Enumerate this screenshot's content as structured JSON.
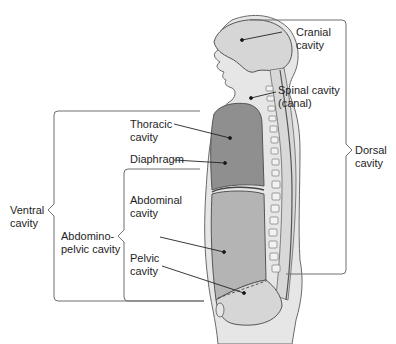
{
  "labels": {
    "cranial": [
      "Cranial",
      "cavity"
    ],
    "spinal": [
      "Spinal cavity",
      "(canal)"
    ],
    "thoracic": [
      "Thoracic",
      "cavity"
    ],
    "diaphragm": "Diaphragm",
    "abdominal": [
      "Abdominal",
      "cavity"
    ],
    "pelvic": [
      "Pelvic",
      "cavity"
    ],
    "ventral": [
      "Ventral",
      "cavity"
    ],
    "abdominopelvic": [
      "Abdomino-",
      "pelvic cavity"
    ],
    "dorsal": [
      "Dorsal",
      "cavity"
    ]
  },
  "colors": {
    "body": "#e4e4e4",
    "cavity_light": "#d2d2d2",
    "cavity_dark": "#8e8e8e",
    "outline": "#5a5a5a",
    "bracket": "#6e6e6e",
    "text": "#1e1e1e"
  }
}
